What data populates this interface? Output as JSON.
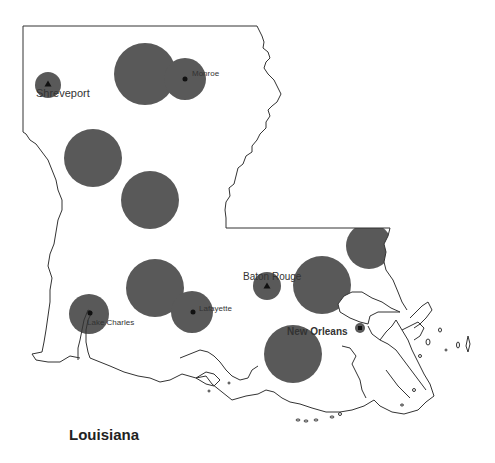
{
  "map": {
    "title": "Louisiana",
    "colors": {
      "background": "#ffffff",
      "outline": "#333333",
      "circle_fill": "#595959",
      "marker": "#111111",
      "label": "#333333"
    },
    "cities": [
      {
        "name": "Shreveport",
        "marker": "triangle",
        "x": 48,
        "y": 84,
        "label_x": 36,
        "label_y": 97,
        "bold": false,
        "font_size": 11
      },
      {
        "name": "Monroe",
        "marker": "dot",
        "x": 185,
        "y": 79,
        "label_x": 192,
        "label_y": 76,
        "bold": false,
        "font_size": 8
      },
      {
        "name": "Baton Rouge",
        "marker": "triangle",
        "x": 267,
        "y": 286,
        "label_x": 243,
        "label_y": 280,
        "bold": false,
        "font_size": 10
      },
      {
        "name": "Lafayette",
        "marker": "dot",
        "x": 193,
        "y": 312,
        "label_x": 199,
        "label_y": 311,
        "bold": false,
        "font_size": 8
      },
      {
        "name": "Lake Charles",
        "marker": "dot",
        "x": 90,
        "y": 313,
        "label_x": 87,
        "label_y": 325,
        "bold": false,
        "font_size": 8
      },
      {
        "name": "New Orleans",
        "marker": "square",
        "x": 360,
        "y": 328,
        "label_x": 287,
        "label_y": 335,
        "bold": true,
        "font_size": 10
      }
    ],
    "circles": [
      {
        "id": "shreveport",
        "cx": 48,
        "cy": 85,
        "r": 13
      },
      {
        "id": "north-central",
        "cx": 145,
        "cy": 74,
        "r": 31
      },
      {
        "id": "monroe",
        "cx": 185,
        "cy": 79,
        "r": 21
      },
      {
        "id": "west-central",
        "cx": 93,
        "cy": 158,
        "r": 29
      },
      {
        "id": "central",
        "cx": 150,
        "cy": 200,
        "r": 29
      },
      {
        "id": "florida-parishes",
        "cx": 369,
        "cy": 246,
        "r": 23
      },
      {
        "id": "baton-rouge-east",
        "cx": 322,
        "cy": 285,
        "r": 29
      },
      {
        "id": "baton-rouge",
        "cx": 267,
        "cy": 286,
        "r": 14
      },
      {
        "id": "acadiana",
        "cx": 155,
        "cy": 288,
        "r": 29
      },
      {
        "id": "lafayette",
        "cx": 192,
        "cy": 312,
        "r": 21
      },
      {
        "id": "lake-charles",
        "cx": 89,
        "cy": 314,
        "r": 20
      },
      {
        "id": "south-central",
        "cx": 293,
        "cy": 354,
        "r": 29
      },
      {
        "id": "new-orleans",
        "cx": 360,
        "cy": 328,
        "r": 5
      }
    ]
  }
}
